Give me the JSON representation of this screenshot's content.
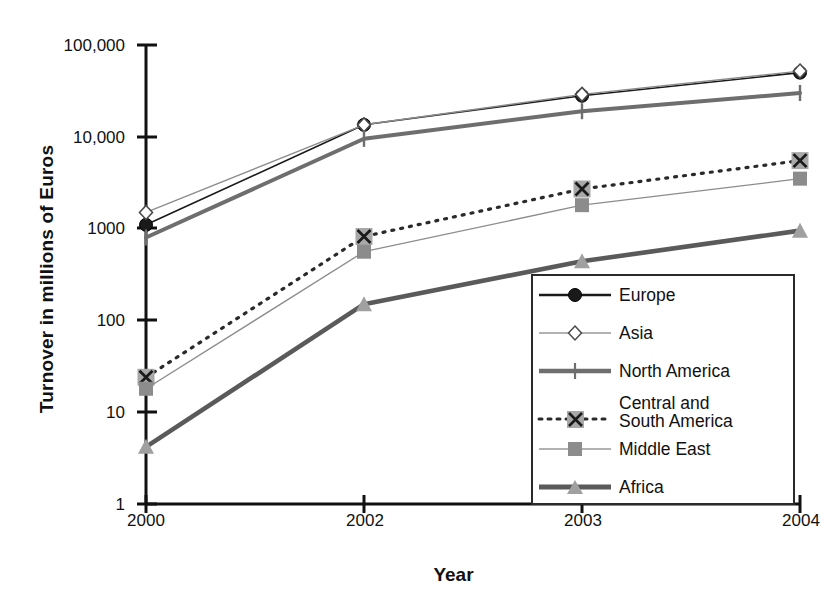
{
  "chart_data": {
    "type": "line",
    "title": "",
    "xlabel": "Year",
    "ylabel": "Turnover in millions of Euros",
    "x_categories": [
      "2000",
      "2002",
      "2003",
      "2004"
    ],
    "x_tick_labels": [
      "2000",
      "2002",
      "2003",
      "2004"
    ],
    "y_scale": "log",
    "ylim": [
      1,
      100000
    ],
    "y_tick_labels": [
      "100,000",
      "10,000",
      "1000",
      "100",
      "10",
      "1"
    ],
    "y_tick_values": [
      100000,
      10000,
      1000,
      100,
      10,
      1
    ],
    "grid": false,
    "legend_position": "bottom-right inside plot",
    "series": [
      {
        "name": "Europe",
        "values": [
          1100,
          13500,
          28000,
          50000
        ],
        "color": "#1a1a1a",
        "marker": "circle",
        "line_style": "solid",
        "line_width": 1.6
      },
      {
        "name": "Asia",
        "values": [
          1500,
          13500,
          29000,
          52000
        ],
        "color": "#8c8c8c",
        "marker": "diamond-open",
        "line_style": "solid",
        "line_width": 1.4
      },
      {
        "name": "North America",
        "values": [
          800,
          9500,
          19000,
          30000
        ],
        "color": "#6e6e6e",
        "marker": "plus",
        "line_style": "solid",
        "line_width": 4.0
      },
      {
        "name": "Central and\nSouth America",
        "values": [
          24,
          820,
          2700,
          5500
        ],
        "color": "#2a2a2a",
        "marker": "x-square",
        "line_style": "dotted",
        "line_width": 2.6
      },
      {
        "name": "Middle East",
        "values": [
          18,
          560,
          1800,
          3500
        ],
        "color": "#8c8c8c",
        "marker": "square",
        "line_style": "solid",
        "line_width": 1.3
      },
      {
        "name": "Africa",
        "values": [
          4.2,
          150,
          440,
          950
        ],
        "color": "#5a5a5a",
        "marker": "triangle",
        "line_style": "solid",
        "line_width": 4.6
      }
    ]
  },
  "axes": {
    "y_title": "Turnover in millions of Euros",
    "x_title": "Year"
  },
  "legend": {
    "items": [
      {
        "label": "Europe"
      },
      {
        "label": "Asia"
      },
      {
        "label": "North America"
      },
      {
        "label": "Central and\nSouth America"
      },
      {
        "label": "Middle East"
      },
      {
        "label": "Africa"
      }
    ]
  }
}
